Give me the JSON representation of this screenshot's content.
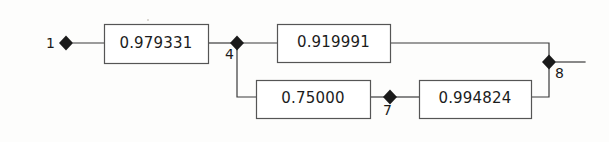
{
  "diagram": {
    "type": "reliability-block-diagram",
    "title": "",
    "background_color": "#fdfdfc",
    "line_color": "#3a3a3a",
    "box_stroke_color": "#555555",
    "box_fill_color": "#ffffff",
    "node_fill_color": "#1a1a1a",
    "blocks": [
      {
        "id": "block-1",
        "value": "0.979331",
        "x": 104,
        "y": 24,
        "width": 104,
        "height": 39
      },
      {
        "id": "block-2",
        "value": "0.919991",
        "x": 277,
        "y": 24,
        "width": 113,
        "height": 38
      },
      {
        "id": "block-3",
        "value": "0.75000",
        "x": 256,
        "y": 80,
        "width": 114,
        "height": 38
      },
      {
        "id": "block-4",
        "value": "0.994824",
        "x": 419,
        "y": 80,
        "width": 112,
        "height": 38
      }
    ],
    "nodes": [
      {
        "id": "node-1",
        "label": "1",
        "x": 66,
        "y": 43,
        "label_x": 46,
        "label_y": 36
      },
      {
        "id": "node-4",
        "label": "4",
        "x": 237,
        "y": 43,
        "label_x": 225,
        "label_y": 47
      },
      {
        "id": "node-7",
        "label": "7",
        "x": 390,
        "y": 97,
        "label_x": 383,
        "label_y": 103
      },
      {
        "id": "node-8",
        "label": "8",
        "x": 549,
        "y": 62,
        "label_x": 555,
        "label_y": 66
      }
    ],
    "connections": [
      {
        "id": "conn-node1-block1",
        "points": "73,43 104,43"
      },
      {
        "id": "conn-block1-node4",
        "points": "208,43 231,43"
      },
      {
        "id": "conn-node4-block2",
        "points": "243,43 277,43"
      },
      {
        "id": "conn-block2-node8",
        "points": "390,43 549,43 549,56"
      },
      {
        "id": "conn-node4-block3",
        "points": "237,49 237,97 256,97"
      },
      {
        "id": "conn-block3-node7",
        "points": "370,97 384,97"
      },
      {
        "id": "conn-node7-block4",
        "points": "396,97 419,97"
      },
      {
        "id": "conn-block4-node8",
        "points": "531,97 549,97 549,68"
      },
      {
        "id": "conn-node8-output",
        "points": "556,62 585,62"
      }
    ]
  }
}
